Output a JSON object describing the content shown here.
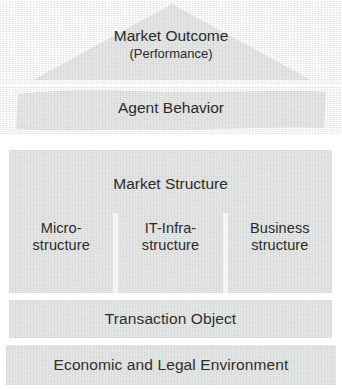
{
  "diagram": {
    "background_color": "#ffffff",
    "block_fill_color": "#e8e9e9",
    "text_color": "#2b2b2b",
    "layers": [
      {
        "id": "market-outcome",
        "shape": "triangle",
        "label_line1": "Market Outcome",
        "label_line2": "(Performance)"
      },
      {
        "id": "agent-behavior",
        "shape": "wavy-band",
        "label": "Agent Behavior"
      },
      {
        "id": "market-structure",
        "shape": "rectangle",
        "label": "Market Structure",
        "columns": [
          {
            "id": "micro-structure",
            "line1": "Micro-",
            "line2": "structure"
          },
          {
            "id": "it-infra-structure",
            "line1": "IT-Infra-",
            "line2": "structure"
          },
          {
            "id": "business-structure",
            "line1": "Business",
            "line2": "structure"
          }
        ]
      },
      {
        "id": "transaction-object",
        "shape": "rectangle",
        "label": "Transaction Object"
      },
      {
        "id": "economic-legal-environment",
        "shape": "rectangle",
        "label": "Economic and Legal Environment"
      }
    ]
  }
}
